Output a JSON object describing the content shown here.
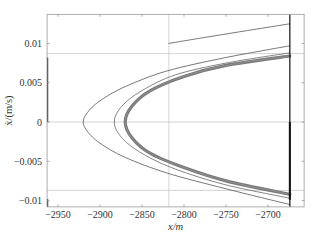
{
  "chart_data": {
    "type": "line",
    "title": "",
    "xlabel": "x/m",
    "ylabel": "ẋ/(m/s)",
    "xlim": [
      -2963,
      -2657
    ],
    "ylim": [
      -0.0108,
      0.0137
    ],
    "grid": false,
    "x_ticks": [
      -2950,
      -2900,
      -2850,
      -2800,
      -2750,
      -2700
    ],
    "x_tick_labels": [
      "−2950",
      "−2900",
      "−2850",
      "−2800",
      "−2750",
      "−2700"
    ],
    "y_ticks": [
      0.01,
      0.005,
      0,
      -0.005,
      -0.01
    ],
    "y_tick_labels": [
      "0.01",
      "0.005",
      "0",
      "−0.005",
      "−0.01"
    ],
    "reference_lines": {
      "horizontal": [
        0.0087,
        0,
        -0.0087
      ],
      "vertical": [
        -2818
      ],
      "boundary": -2674
    },
    "series": [
      {
        "name": "outer trajectory",
        "color": "#555555",
        "width": 0.8,
        "points": [
          [
            -2674,
            -0.0105
          ],
          [
            -2750,
            -0.0085
          ],
          [
            -2820,
            -0.0065
          ],
          [
            -2870,
            -0.0045
          ],
          [
            -2900,
            -0.0027
          ],
          [
            -2915,
            -0.0012
          ],
          [
            -2920,
            0
          ],
          [
            -2915,
            0.0012
          ],
          [
            -2900,
            0.0027
          ],
          [
            -2870,
            0.0045
          ],
          [
            -2820,
            0.0065
          ],
          [
            -2750,
            0.0082
          ],
          [
            -2674,
            0.0097
          ]
        ]
      },
      {
        "name": "upper return branch",
        "color": "#555555",
        "width": 0.8,
        "points": [
          [
            -2818,
            0.01
          ],
          [
            -2750,
            0.0112
          ],
          [
            -2674,
            0.0125
          ]
        ]
      },
      {
        "name": "middle trajectory",
        "color": "#666666",
        "width": 0.8,
        "points": [
          [
            -2674,
            -0.0097
          ],
          [
            -2750,
            -0.008
          ],
          [
            -2810,
            -0.006
          ],
          [
            -2850,
            -0.004
          ],
          [
            -2874,
            -0.002
          ],
          [
            -2883,
            0
          ],
          [
            -2874,
            0.002
          ],
          [
            -2850,
            0.004
          ],
          [
            -2810,
            0.006
          ],
          [
            -2750,
            0.0075
          ],
          [
            -2674,
            0.0088
          ]
        ]
      },
      {
        "name": "converged orbit band",
        "color": "#7a7a7a",
        "width": 3.2,
        "points": [
          [
            -2674,
            -0.0092
          ],
          [
            -2750,
            -0.0075
          ],
          [
            -2800,
            -0.0058
          ],
          [
            -2840,
            -0.004
          ],
          [
            -2862,
            -0.002
          ],
          [
            -2870,
            0
          ],
          [
            -2862,
            0.002
          ],
          [
            -2840,
            0.004
          ],
          [
            -2800,
            0.0058
          ],
          [
            -2750,
            0.0072
          ],
          [
            -2674,
            0.0084
          ]
        ]
      }
    ]
  }
}
